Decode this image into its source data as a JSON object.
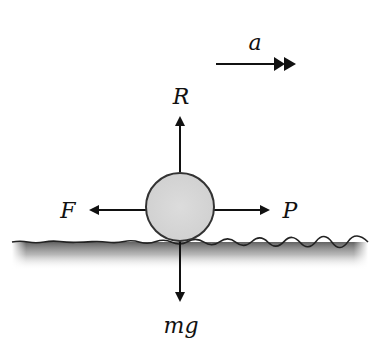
{
  "diagram": {
    "acceleration": {
      "label": "a",
      "direction": "right"
    },
    "forces": {
      "normal": {
        "label": "R",
        "direction": "up"
      },
      "friction": {
        "label": "F",
        "direction": "left"
      },
      "pull": {
        "label": "P",
        "direction": "right"
      },
      "weight": {
        "label": "mg",
        "direction": "down"
      }
    },
    "body": {
      "shape": "circle",
      "fill": "#d9d9d9",
      "stroke": "#333333"
    },
    "ground": {
      "type": "rough surface",
      "shade": "#6b6b6b"
    },
    "colors": {
      "arrow": "#111111",
      "background": "#ffffff"
    }
  }
}
